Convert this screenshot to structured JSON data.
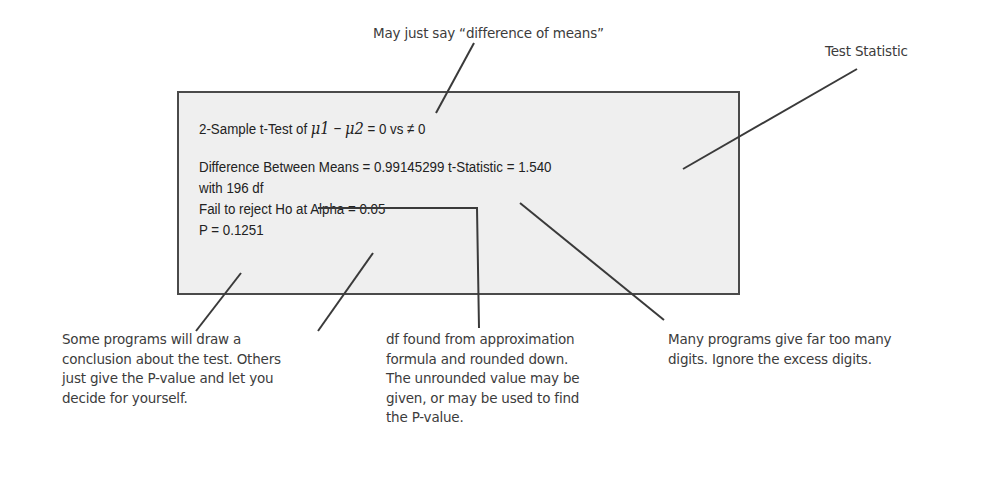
{
  "output_box": {
    "line1_prefix": "2-Sample t-Test of ",
    "line1_mu1": "μ1",
    "line1_minus": " − ",
    "line1_mu2": "μ2",
    "line1_suffix": " = 0 vs ≠ 0",
    "line2": "Difference Between Means = 0.99145299 t-Statistic = 1.540",
    "line3": "with 196 df",
    "line4": "Fail to reject Ho at Alpha = 0.05",
    "line5": "P = 0.1251"
  },
  "annotations": {
    "top_center": "May just say “difference of means”",
    "top_right": "Test Statistic",
    "bottom_left": [
      "Some programs will draw a",
      "conclusion about the test. Others",
      "just give the P-value and let you",
      "decide for yourself."
    ],
    "bottom_middle": [
      "df found from approximation",
      "formula and rounded down.",
      "The unrounded value may be",
      "given, or may be used to find",
      "the P-value."
    ],
    "bottom_right": [
      "Many programs give far too many",
      "digits. Ignore the excess digits."
    ]
  },
  "colors": {
    "box_fill": "#efefef",
    "box_border": "#4a4a4a",
    "leader_line": "#3a3a3a",
    "annotation_text": "#3c3c3c",
    "output_text": "#222222"
  }
}
